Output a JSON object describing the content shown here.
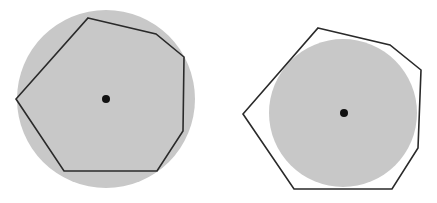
{
  "colors": {
    "background": "#ffffff",
    "disk_fill": "#c8c8c8",
    "outline": "#2a2a2a",
    "center_dot": "#111111"
  },
  "figures": [
    {
      "name": "inscribed-polygon",
      "circle": {
        "cx": 106,
        "cy": 99,
        "r": 89
      },
      "polygon": [
        [
          88,
          18
        ],
        [
          156,
          34
        ],
        [
          184,
          57
        ],
        [
          183,
          131
        ],
        [
          157,
          171
        ],
        [
          64,
          171
        ],
        [
          16,
          99
        ]
      ],
      "center": {
        "cx": 106,
        "cy": 99,
        "r": 4
      }
    },
    {
      "name": "circumscribed-polygon",
      "circle": {
        "cx": 343,
        "cy": 113,
        "r": 74
      },
      "polygon": [
        [
          318,
          28
        ],
        [
          390,
          45
        ],
        [
          421,
          70
        ],
        [
          418,
          148
        ],
        [
          392,
          189
        ],
        [
          294,
          189
        ],
        [
          243,
          114
        ]
      ],
      "center": {
        "cx": 344,
        "cy": 113,
        "r": 4
      }
    }
  ]
}
